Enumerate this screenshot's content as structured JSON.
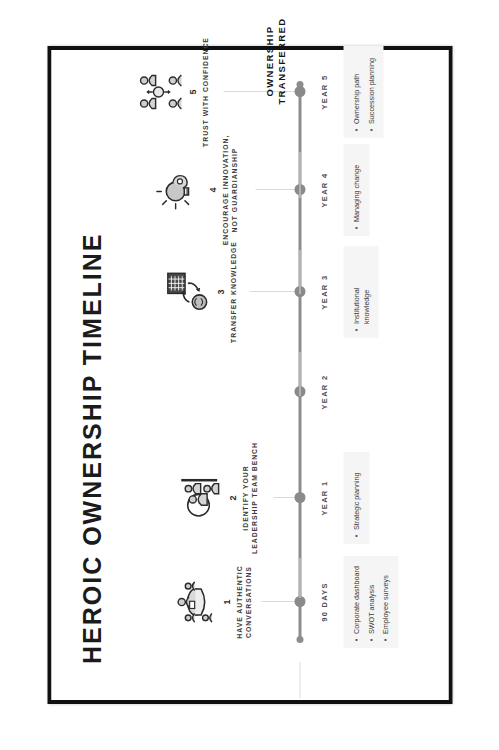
{
  "poster": {
    "title": "HEROIC OWNERSHIP TIMELINE",
    "frame_color": "#111111",
    "background_color": "#ffffff",
    "axis_color": "#8d8d8d",
    "accent_color": "#8a8a8a"
  },
  "final_callout": {
    "line1": "OWNERSHIP",
    "line2": "TRANSFERRED"
  },
  "milestones": [
    {
      "number": "1",
      "label": "HAVE AUTHENTIC CONVERSATIONS",
      "icon": "meeting-table-icon",
      "year": "90 DAYS",
      "bullets": [
        "Corporate dashboard",
        "SWOT analysis",
        "Employee surveys"
      ]
    },
    {
      "number": "2",
      "label": "IDENTIFY YOUR LEADERSHIP TEAM BENCH",
      "icon": "team-bench-icon",
      "year": "YEAR 1",
      "bullets": [
        "Strategic planning"
      ]
    },
    {
      "number": "3",
      "label": "TRANSFER KNOWLEDGE",
      "icon": "knowledge-transfer-icon",
      "year": "YEAR 3",
      "bullets": [
        "Institutional knowledge"
      ]
    },
    {
      "number": "4",
      "label": "ENCOURAGE INNOVATION, NOT GUARDIANSHIP",
      "icon": "lightbulb-innovation-icon",
      "year": "YEAR 4",
      "bullets": [
        "Managing change"
      ]
    },
    {
      "number": "5",
      "label": "TRUST WITH CONFIDENCE",
      "icon": "handshake-trust-icon",
      "year": "YEAR 5",
      "bullets": [
        "Ownership path",
        "Succession planning"
      ]
    }
  ],
  "extra_year_marker": {
    "year": "YEAR 2"
  }
}
